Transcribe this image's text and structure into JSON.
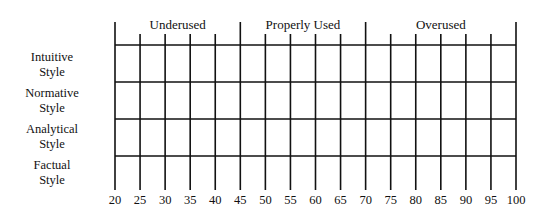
{
  "chart_data": {
    "type": "table",
    "title": "",
    "xlabel": "",
    "ylabel": "",
    "xlim": [
      20,
      100
    ],
    "x_ticks": [
      20,
      25,
      30,
      35,
      40,
      45,
      50,
      55,
      60,
      65,
      70,
      75,
      80,
      85,
      90,
      95,
      100
    ],
    "major_boundaries": [
      20,
      45,
      70,
      100
    ],
    "zones": [
      {
        "label": "Underused",
        "from": 20,
        "to": 45
      },
      {
        "label": "Properly Used",
        "from": 45,
        "to": 70
      },
      {
        "label": "Overused",
        "from": 70,
        "to": 100
      }
    ],
    "rows": [
      {
        "line1": "Intuitive",
        "line2": "Style"
      },
      {
        "line1": "Normative",
        "line2": "Style"
      },
      {
        "line1": "Analytical",
        "line2": "Style"
      },
      {
        "line1": "Factual",
        "line2": "Style"
      }
    ],
    "grid": true,
    "values": []
  },
  "colors": {
    "line": "#111111",
    "text": "#111111",
    "background": "#ffffff"
  }
}
